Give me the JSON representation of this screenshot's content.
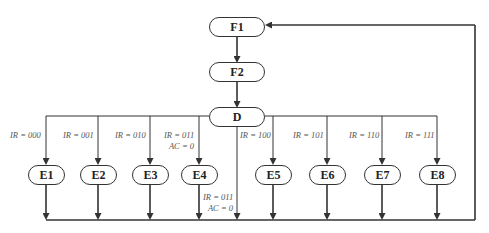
{
  "diagram": {
    "type": "flowchart",
    "colors": {
      "line": "#333333",
      "text": "#222222",
      "label": "#555555",
      "background": "#ffffff"
    },
    "nodes": {
      "f1": {
        "label": "F1"
      },
      "f2": {
        "label": "F2"
      },
      "d": {
        "label": "D"
      },
      "e1": {
        "label": "E1"
      },
      "e2": {
        "label": "E2"
      },
      "e3": {
        "label": "E3"
      },
      "e4": {
        "label": "E4"
      },
      "e5": {
        "label": "E5"
      },
      "e6": {
        "label": "E6"
      },
      "e7": {
        "label": "E7"
      },
      "e8": {
        "label": "E8"
      }
    },
    "conditions": {
      "e1": "IR = 000",
      "e2": "IR = 001",
      "e3": "IR = 010",
      "e4_line1": "IR = 011",
      "e4_line2": "AC = 0",
      "skip_line1": "IR = 011",
      "skip_line2": "AC = 0",
      "e5": "IR = 100",
      "e6": "IR = 101",
      "e7": "IR = 110",
      "e8": "IR = 111"
    },
    "edges": [
      {
        "from": "F1",
        "to": "F2"
      },
      {
        "from": "F2",
        "to": "D"
      },
      {
        "from": "D",
        "to": "E1",
        "condition": "IR = 000"
      },
      {
        "from": "D",
        "to": "E2",
        "condition": "IR = 001"
      },
      {
        "from": "D",
        "to": "E3",
        "condition": "IR = 010"
      },
      {
        "from": "D",
        "to": "E4",
        "condition": "IR = 011, AC = 0"
      },
      {
        "from": "D",
        "to": "F1",
        "condition": "IR = 011, AC = 0 (bypass)"
      },
      {
        "from": "D",
        "to": "E5",
        "condition": "IR = 100"
      },
      {
        "from": "D",
        "to": "E6",
        "condition": "IR = 101"
      },
      {
        "from": "D",
        "to": "E7",
        "condition": "IR = 110"
      },
      {
        "from": "D",
        "to": "E8",
        "condition": "IR = 111"
      },
      {
        "from": "E1..E8",
        "to": "F1",
        "condition": "return"
      }
    ]
  }
}
